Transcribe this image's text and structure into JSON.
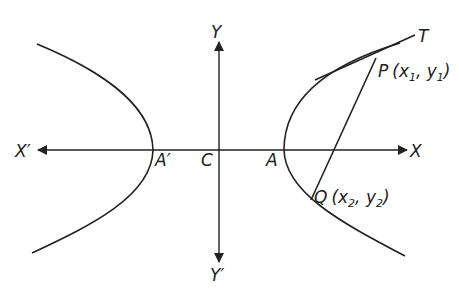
{
  "diagram": {
    "title": "",
    "type": "hyperbola",
    "labels": {
      "y_axis_pos": "Y",
      "y_axis_neg": "Y′",
      "x_axis_pos": "X",
      "x_axis_neg": "X′",
      "center": "C",
      "vertex_right": "A",
      "vertex_left": "A′",
      "tangent": "T",
      "point_p": "P",
      "point_p_coords_open": "(x",
      "point_p_x_sub": "1",
      "point_p_mid": ", y",
      "point_p_y_sub": "1",
      "point_p_close": ")",
      "point_q": "Q",
      "point_q_coords_open": "(x",
      "point_q_x_sub": "2",
      "point_q_mid": ", y",
      "point_q_y_sub": "2",
      "point_q_close": ")"
    },
    "elements": [
      "hyperbola left branch through A'",
      "hyperbola right branch through A",
      "x-axis X'X",
      "y-axis Y'Y",
      "tangent line at P toward T",
      "chord PQ"
    ],
    "colors": {
      "stroke": "#222222",
      "background": "#ffffff"
    }
  }
}
